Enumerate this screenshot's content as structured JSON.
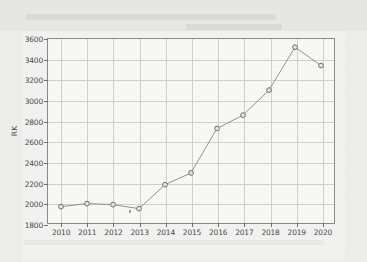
{
  "chart_data": {
    "type": "line",
    "title": "",
    "xlabel": "",
    "ylabel": "RK",
    "categories": [
      "2010",
      "2011",
      "2012",
      "2013",
      "2014",
      "2015",
      "2016",
      "2017",
      "2018",
      "2019",
      "2020"
    ],
    "x": [
      2010,
      2011,
      2012,
      2013,
      2014,
      2015,
      2016,
      2017,
      2018,
      2019,
      2020
    ],
    "values": [
      1960,
      1990,
      1980,
      1940,
      2175,
      2290,
      2725,
      2855,
      3100,
      3520,
      3340
    ],
    "series": [
      {
        "name": "RK",
        "values": [
          1960,
          1990,
          1980,
          1940,
          2175,
          2290,
          2725,
          2855,
          3100,
          3520,
          3340
        ]
      }
    ],
    "ylim": [
      1800,
      3600
    ],
    "xlim": [
      2009.5,
      2020.5
    ],
    "yticks": [
      1800,
      2000,
      2200,
      2400,
      2600,
      2800,
      3000,
      3200,
      3400,
      3600
    ],
    "ytick_labels": [
      "1800",
      "2000",
      "2200",
      "2400",
      "2600",
      "2800",
      "3000",
      "3200",
      "3400",
      "3600"
    ],
    "xticks": [
      2010,
      2011,
      2012,
      2013,
      2014,
      2015,
      2016,
      2017,
      2018,
      2019,
      2020
    ],
    "xtick_labels": [
      "2010",
      "2011",
      "2012",
      "2013",
      "2014",
      "2015",
      "2016",
      "2017",
      "2018",
      "2019",
      "2020"
    ],
    "grid": true,
    "legend": false,
    "legend_position": "none",
    "marker": "circle",
    "line_color": "#8f8f8d",
    "marker_fill": "#e3e3e1",
    "marker_edge": "#6e6e6c",
    "grid_color": "#cfcfcd",
    "axis_color": "#8a8a88",
    "text_color": "#4a4a48",
    "plot_background": "#fcfcfb",
    "figure_background": "#f1f1f0"
  }
}
